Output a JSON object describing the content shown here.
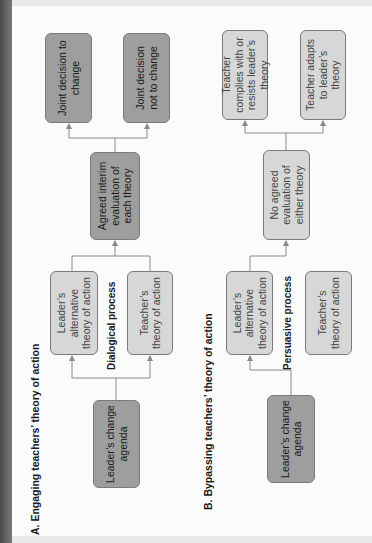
{
  "section_a": {
    "title": "A. Engaging teachers’ theory of action",
    "process_label": "Dialogical process",
    "nodes": {
      "leader_agenda": "Leader’s change agenda",
      "leader_alt": "Leader’s alternative theory of action",
      "teacher_theory": "Teacher’s theory of action",
      "evaluation": "Agreed interim evaluation of each theory",
      "outcome_1": "Joint decision to change",
      "outcome_2": "Joint decision not to change"
    }
  },
  "section_b": {
    "title": "B. Bypassing teachers’ theory of action",
    "process_label": "Persuasive process",
    "nodes": {
      "leader_agenda": "Leader’s change agenda",
      "leader_alt": "Leader’s alternative theory of action",
      "teacher_theory": "Teacher’s theory of action",
      "evaluation": "No agreed evaluation of either theory",
      "outcome_1": "Teacher complies with or resists leader’s theory",
      "outcome_2": "Teacher adapts to leader’s theory"
    }
  },
  "colors": {
    "dark_box": "#9e9e9e",
    "light_box": "#d7d7d7",
    "connector": "#8a8a8a",
    "page": "#fbfbfb",
    "spine": "#5a5a5a"
  }
}
